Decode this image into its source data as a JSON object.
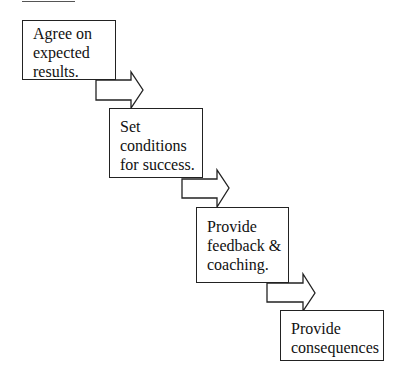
{
  "diagram": {
    "type": "staircase-process-flow",
    "heading_cropped": true,
    "steps": [
      {
        "id": 1,
        "lines": [
          "Agree on",
          "expected",
          "results."
        ]
      },
      {
        "id": 2,
        "lines": [
          "Set",
          "conditions",
          "for success."
        ]
      },
      {
        "id": 3,
        "lines": [
          "Provide",
          "feedback &",
          "coaching."
        ]
      },
      {
        "id": 4,
        "lines": [
          "Provide",
          "consequences"
        ]
      }
    ],
    "connectors": [
      {
        "from": 1,
        "to": 2,
        "icon": "block-arrow-right-icon"
      },
      {
        "from": 2,
        "to": 3,
        "icon": "block-arrow-right-icon"
      },
      {
        "from": 3,
        "to": 4,
        "icon": "block-arrow-right-icon"
      }
    ],
    "colors": {
      "stroke": "#222222",
      "fill": "#ffffff",
      "text": "#111111",
      "background": "#ffffff"
    }
  }
}
